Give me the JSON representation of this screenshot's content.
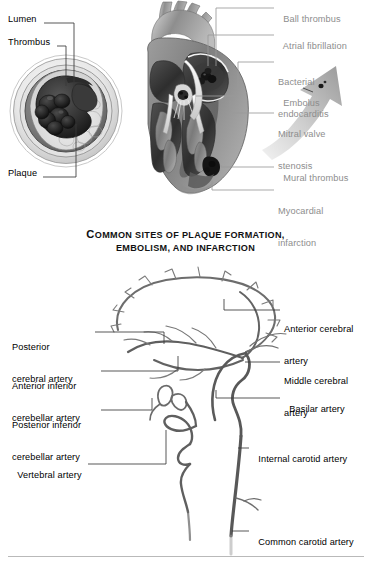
{
  "page": {
    "background": "#ffffff",
    "label_color": "#000000",
    "gray_label_color": "#8d8d8d",
    "rule_color": "#b9b9b9"
  },
  "figure_top": {
    "title": "Artery cross-section and heart cutaway",
    "artery_labels": [
      {
        "text": "Lumen",
        "x": 8,
        "y": 19
      },
      {
        "text": "Thrombus",
        "x": 8,
        "y": 42
      },
      {
        "text": "Plaque",
        "x": 8,
        "y": 173
      }
    ],
    "heart_labels": [
      {
        "text": "Ball thrombus",
        "x": 277,
        "y": 4,
        "lines": [
          "Ball thrombus"
        ]
      },
      {
        "text": "Atrial fibrillation",
        "x": 277,
        "y": 31,
        "lines": [
          "Atrial fibrillation"
        ]
      },
      {
        "text": "Bacterial endocarditis",
        "x": 277,
        "y": 55,
        "lines": [
          "Bacterial",
          "endocarditis"
        ]
      },
      {
        "text": "Embolus",
        "x": 277,
        "y": 88,
        "lines": [
          "Embolus"
        ]
      },
      {
        "text": "Mitral valve stenosis",
        "x": 277,
        "y": 108,
        "lines": [
          "Mitral valve",
          "stenosis"
        ]
      },
      {
        "text": "Mural thrombus",
        "x": 277,
        "y": 163,
        "lines": [
          "Mural thrombus"
        ]
      },
      {
        "text": "Myocardial infarction",
        "x": 277,
        "y": 185,
        "lines": [
          "Myocardial",
          "infarction"
        ]
      }
    ]
  },
  "caption": {
    "line1_lead": "C",
    "line1_rest": "OMMON SITES OF PLAQUE FORMATION,",
    "line2": "EMBOLISM, AND INFARCTION",
    "full_text": "COMMON SITES OF PLAQUE FORMATION, EMBOLISM, AND INFARCTION",
    "y": 228
  },
  "figure_bottom": {
    "title": "Cerebral and cervical arterial circulation",
    "left_labels": [
      {
        "lines": [
          "Posterior",
          "cerebral artery"
        ],
        "x": 12,
        "y": 322
      },
      {
        "lines": [
          "Anterior inferior",
          "cerebellar artery"
        ],
        "x": 12,
        "y": 361
      },
      {
        "lines": [
          "Posterior inferior",
          "cerebellar artery"
        ],
        "x": 12,
        "y": 400
      },
      {
        "lines": [
          "Vertebral artery"
        ],
        "x": 12,
        "y": 460
      }
    ],
    "right_labels": [
      {
        "lines": [
          "Anterior cerebral",
          "artery"
        ],
        "x": 283,
        "y": 303
      },
      {
        "lines": [
          "Middle cerebral",
          "artery"
        ],
        "x": 283,
        "y": 355
      },
      {
        "lines": [
          "Basilar artery"
        ],
        "x": 283,
        "y": 394
      },
      {
        "lines": [
          "Internal carotid artery"
        ],
        "x": 252,
        "y": 444
      },
      {
        "lines": [
          "Common carotid artery"
        ],
        "x": 252,
        "y": 527
      }
    ]
  },
  "footer_rule": {
    "x": 8,
    "y": 556,
    "width": 356
  }
}
